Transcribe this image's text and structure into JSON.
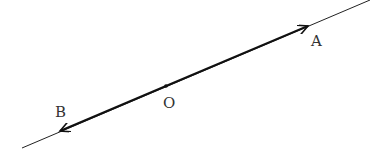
{
  "diagram": {
    "line": {
      "x1": 22,
      "y1": 148,
      "x2": 370,
      "y2": 0,
      "color": "#222222"
    },
    "point_O": {
      "x": 166,
      "y": 86,
      "label": "O",
      "label_x": 163,
      "label_y": 108
    },
    "vector_OA": {
      "from": "O",
      "tip_x": 308,
      "tip_y": 26,
      "label": "A",
      "label_x": 311,
      "label_y": 46
    },
    "vector_OB": {
      "from": "O",
      "tip_x": 60,
      "tip_y": 131,
      "label": "B",
      "label_x": 55,
      "label_y": 117
    }
  }
}
